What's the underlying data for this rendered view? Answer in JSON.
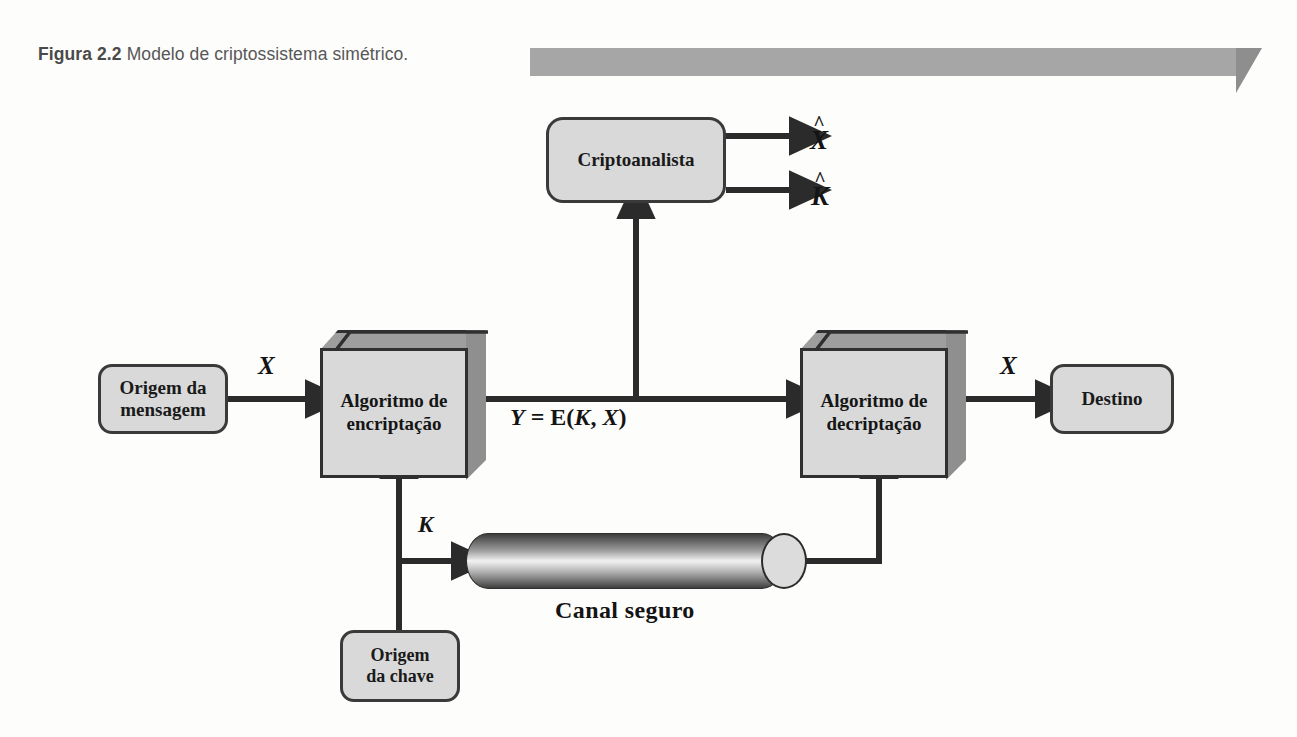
{
  "caption": {
    "figure_number": "Figura 2.2",
    "text": "Modelo de criptossistema simétrico."
  },
  "diagram": {
    "title": "Modelo de criptossistema simétrico",
    "boxes": {
      "message_source": "Origem da\nmensagem",
      "encryption_algorithm": "Algoritmo de\nencriptação",
      "decryption_algorithm": "Algoritmo de\ndecriptação",
      "destination": "Destino",
      "cryptanalyst": "Criptoanalista",
      "key_source": "Origem\nda chave"
    },
    "labels": {
      "plaintext_in": "X",
      "plaintext_out": "X",
      "ciphertext": "Y = E(K, X)",
      "key": "K",
      "secure_channel": "Canal seguro",
      "estimated_plaintext_hat": "^",
      "estimated_plaintext": "X",
      "estimated_key_hat": "^",
      "estimated_key": "K"
    },
    "colors": {
      "box_fill": "#d9d9d9",
      "box_border": "#303030",
      "cube_top": "#9e9e9e",
      "cube_right": "#8f8f8f",
      "ribbon": "#a6a6a6",
      "ribbon_fold": "#8e8e8e",
      "page_background": "#fdfdfb",
      "caption_text": "#575757",
      "line": "#2b2b2b"
    }
  }
}
